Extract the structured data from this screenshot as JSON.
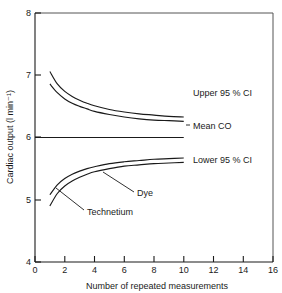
{
  "chart_data": {
    "type": "line",
    "title": "",
    "xlabel": "Number of repeated measurements",
    "ylabel": "Cardiac output (l min⁻¹)",
    "xlim": [
      0,
      16
    ],
    "ylim": [
      4,
      8
    ],
    "xticks": [
      "0",
      "2",
      "4",
      "6",
      "8",
      "10",
      "12",
      "14",
      "16"
    ],
    "xtick_values": [
      0,
      2,
      4,
      6,
      8,
      10,
      12,
      14,
      16
    ],
    "yticks": [
      "4",
      "5",
      "6",
      "7",
      "8"
    ],
    "ytick_values": [
      4,
      5,
      6,
      7,
      8
    ],
    "grid": false,
    "legend_position": "inline-annotations",
    "annotations": [
      {
        "text": "Upper 95 % CI",
        "x": 11.1,
        "y": 6.62
      },
      {
        "text": "Mean CO",
        "x": 11.1,
        "y": 5.99
      },
      {
        "text": "Lower 95 % CI",
        "x": 11.1,
        "y": 5.38
      },
      {
        "text": "Dye",
        "x": 7.0,
        "y": 5.05
      },
      {
        "text": "Technetium",
        "x": 4.4,
        "y": 4.76
      }
    ],
    "series": [
      {
        "name": "Upper 95 % CI — Dye",
        "role": "upper-ci",
        "tracer": "Dye",
        "x": [
          1,
          1.5,
          2,
          2.5,
          3,
          3.5,
          4,
          5,
          6,
          7,
          8,
          9,
          10
        ],
        "values": [
          7.06,
          6.86,
          6.74,
          6.66,
          6.6,
          6.55,
          6.51,
          6.45,
          6.41,
          6.38,
          6.36,
          6.34,
          6.33
        ]
      },
      {
        "name": "Upper 95 % CI — Technetium",
        "role": "upper-ci",
        "tracer": "Technetium",
        "x": [
          1,
          1.5,
          2,
          2.5,
          3,
          3.5,
          4,
          5,
          6,
          7,
          8,
          9,
          10
        ],
        "values": [
          6.86,
          6.72,
          6.62,
          6.55,
          6.5,
          6.46,
          6.42,
          6.37,
          6.33,
          6.3,
          6.28,
          6.27,
          6.26
        ]
      },
      {
        "name": "Mean CO",
        "role": "mean",
        "tracer": "",
        "x": [
          0,
          10
        ],
        "values": [
          6.0,
          6.0
        ]
      },
      {
        "name": "Lower 95 % CI — Dye",
        "role": "lower-ci",
        "tracer": "Dye",
        "x": [
          1,
          1.5,
          2,
          2.5,
          3,
          3.5,
          4,
          5,
          6,
          7,
          8,
          9,
          10
        ],
        "values": [
          5.08,
          5.24,
          5.34,
          5.41,
          5.46,
          5.5,
          5.53,
          5.58,
          5.61,
          5.63,
          5.65,
          5.66,
          5.67
        ]
      },
      {
        "name": "Lower 95 % CI — Technetium",
        "role": "lower-ci",
        "tracer": "Technetium",
        "x": [
          1,
          1.5,
          2,
          2.5,
          3,
          3.5,
          4,
          5,
          6,
          7,
          8,
          9,
          10
        ],
        "values": [
          4.9,
          5.1,
          5.22,
          5.3,
          5.36,
          5.41,
          5.45,
          5.5,
          5.54,
          5.56,
          5.58,
          5.59,
          5.6
        ]
      }
    ],
    "colors": {
      "curve": "#1a1a1a",
      "axis": "#1a1a1a",
      "frame": "#555555",
      "background": "#ffffff"
    }
  }
}
